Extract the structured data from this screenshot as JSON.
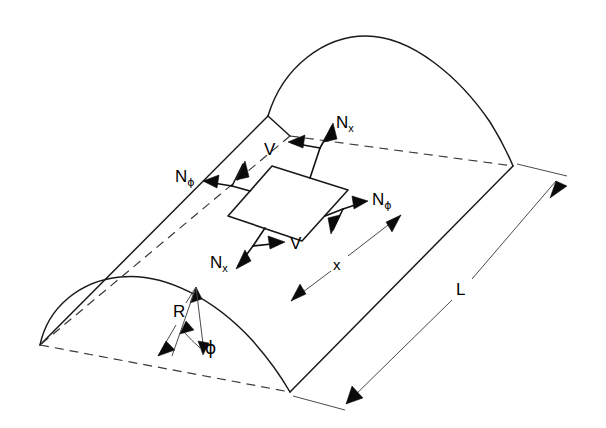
{
  "figure": {
    "kind": "engineering-diagram",
    "background_color": "#ffffff",
    "line_color": "#1a1a1a",
    "hidden_line_color": "#3a3a3a",
    "dimension_line_color": "#4a4a4a"
  },
  "labels": {
    "n_x_top": {
      "base": "N",
      "sub": "x"
    },
    "n_x_bottom": {
      "base": "N",
      "sub": "x"
    },
    "n_phi_left": {
      "base": "N",
      "sub": "ϕ"
    },
    "n_phi_right": {
      "base": "N",
      "sub": "ϕ"
    },
    "v_top": "V",
    "v_bottom": "V",
    "radius": "R",
    "angle": "ϕ",
    "length": "L",
    "axial_coordinate": "x"
  },
  "geometry": {
    "near_arch": {
      "left_springing": [
        40,
        345
      ],
      "crown": [
        163,
        277
      ],
      "right_springing": [
        290,
        392
      ]
    },
    "far_arch": {
      "left_springing": [
        268,
        116
      ],
      "crown": [
        366,
        36
      ],
      "right_springing": [
        513,
        166
      ]
    },
    "base_line": {
      "from": [
        40,
        345
      ],
      "to": [
        290,
        392
      ]
    },
    "ridge_line": {
      "from": [
        268,
        116
      ],
      "to": [
        40,
        345
      ]
    },
    "right_edge": {
      "from": [
        513,
        166
      ],
      "to": [
        290,
        392
      ]
    },
    "stress_element": {
      "corners": [
        [
          228,
          216
        ],
        [
          272,
          166
        ],
        [
          348,
          190
        ],
        [
          302,
          241
        ]
      ]
    },
    "dimension_L": {
      "from": [
        372,
        178
      ],
      "to": [
        556,
        404
      ],
      "label_at": [
        462,
        288
      ]
    },
    "dimension_x": {
      "from": [
        291,
        301
      ],
      "to": [
        401,
        215
      ],
      "label_at": [
        339,
        264
      ]
    },
    "dimension_R": {
      "from": [
        157,
        356
      ],
      "to": [
        196,
        287
      ],
      "label_at": [
        180,
        312
      ]
    },
    "angle_phi": {
      "vertex": [
        198,
        357
      ],
      "label_at": [
        205,
        352
      ]
    }
  }
}
